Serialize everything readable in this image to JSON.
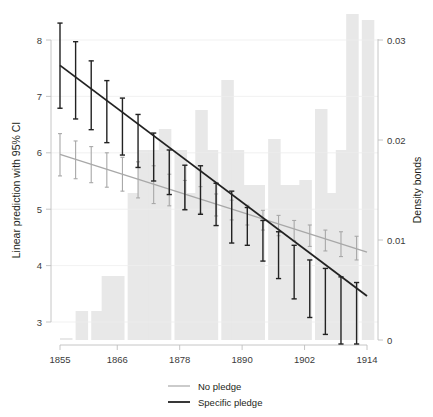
{
  "chart_data": {
    "type": "line",
    "title": "",
    "subtitle": "",
    "xlabel": "",
    "ylabel": "Linear prediction with 95% CI",
    "y2label": "Density bonds",
    "xlim": [
      1855,
      1914
    ],
    "ylim": [
      2.75,
      8.4
    ],
    "y2lim": [
      0,
      0.0325
    ],
    "grid": true,
    "legend_position": "bottom",
    "x_ticks": [
      1855,
      1866,
      1878,
      1890,
      1902,
      1914
    ],
    "x_tick_labels": [
      "1855",
      "1866",
      "1878",
      "1890",
      "1902",
      "1914"
    ],
    "y_ticks": [
      3,
      4,
      5,
      6,
      7,
      8
    ],
    "y_tick_labels": [
      "3",
      "4",
      "5",
      "6",
      "7",
      "8"
    ],
    "y2_ticks": [
      0,
      0.01,
      0.02,
      0.03
    ],
    "y2_tick_labels": [
      "0",
      "0.01",
      "0.02",
      "0.03"
    ],
    "series": [
      {
        "name": "No pledge",
        "color": "#a8a8a8",
        "style": "line-with-ci",
        "fit_x": [
          1855,
          1914
        ],
        "fit_y": [
          5.97,
          4.24
        ],
        "x": [
          1855,
          1858,
          1861,
          1864,
          1867,
          1870,
          1873,
          1876,
          1879,
          1882,
          1885,
          1888,
          1891,
          1894,
          1897,
          1900,
          1903,
          1906,
          1909,
          1912
        ],
        "y": [
          5.97,
          5.88,
          5.79,
          5.7,
          5.61,
          5.52,
          5.43,
          5.34,
          5.25,
          5.16,
          5.07,
          4.98,
          4.89,
          4.8,
          4.71,
          4.62,
          4.53,
          4.44,
          4.38,
          4.3
        ],
        "ci_low": [
          5.59,
          5.54,
          5.47,
          5.39,
          5.32,
          5.2,
          5.1,
          5.06,
          5.0,
          4.93,
          4.88,
          4.81,
          4.72,
          4.63,
          4.53,
          4.44,
          4.34,
          4.26,
          4.16,
          4.1
        ],
        "ci_high": [
          6.34,
          6.21,
          6.11,
          6.0,
          5.92,
          5.84,
          5.77,
          5.62,
          5.51,
          5.4,
          5.27,
          5.16,
          5.07,
          4.98,
          4.89,
          4.8,
          4.72,
          4.63,
          4.6,
          4.52
        ]
      },
      {
        "name": "Specific pledge",
        "color": "#222222",
        "style": "line-with-ci",
        "fit_x": [
          1855,
          1914
        ],
        "fit_y": [
          7.55,
          3.46
        ],
        "x": [
          1855,
          1858,
          1861,
          1864,
          1867,
          1870,
          1873,
          1876,
          1879,
          1882,
          1885,
          1888,
          1891,
          1894,
          1897,
          1900,
          1903,
          1906,
          1909,
          1912
        ],
        "y": [
          7.55,
          7.33,
          7.12,
          6.91,
          6.7,
          6.49,
          6.28,
          6.07,
          5.86,
          5.65,
          5.44,
          5.23,
          5.02,
          4.81,
          4.6,
          4.39,
          4.18,
          3.97,
          3.76,
          3.6
        ],
        "ci_low": [
          6.79,
          6.6,
          6.41,
          6.18,
          5.96,
          5.74,
          5.5,
          5.26,
          4.99,
          4.91,
          4.71,
          4.4,
          4.36,
          4.08,
          3.77,
          3.41,
          3.08,
          2.78,
          2.6,
          2.5
        ],
        "ci_high": [
          8.3,
          7.97,
          7.63,
          7.28,
          6.97,
          6.68,
          6.35,
          6.05,
          5.78,
          5.77,
          5.46,
          5.32,
          5.03,
          4.8,
          4.6,
          4.36,
          4.1,
          3.95,
          3.8,
          3.7
        ]
      }
    ],
    "histogram": {
      "name": "Density bonds",
      "color": "#e8e8e8",
      "axis": "right",
      "bin_left": [
        1855,
        1858,
        1861,
        1863,
        1865,
        1868,
        1870,
        1872,
        1874,
        1877,
        1879,
        1881,
        1883,
        1886,
        1888,
        1890,
        1892,
        1895,
        1897,
        1899,
        1901,
        1904,
        1906,
        1908,
        1910,
        1913
      ],
      "bin_width": 2.4,
      "values": [
        0.0002,
        0.0029,
        0.0029,
        0.0064,
        0.0064,
        0.0147,
        0.019,
        0.019,
        0.0211,
        0.019,
        0.0147,
        0.023,
        0.019,
        0.026,
        0.019,
        0.0155,
        0.0155,
        0.0201,
        0.0155,
        0.0155,
        0.016,
        0.0231,
        0.0147,
        0.019,
        0.0326,
        0.032
      ]
    }
  },
  "legend": {
    "items": [
      {
        "label": "No pledge",
        "color": "#a8a8a8"
      },
      {
        "label": "Specific pledge",
        "color": "#222222"
      }
    ]
  },
  "axes": {
    "left_title": "Linear prediction with 95% CI",
    "right_title": "Density bonds"
  }
}
